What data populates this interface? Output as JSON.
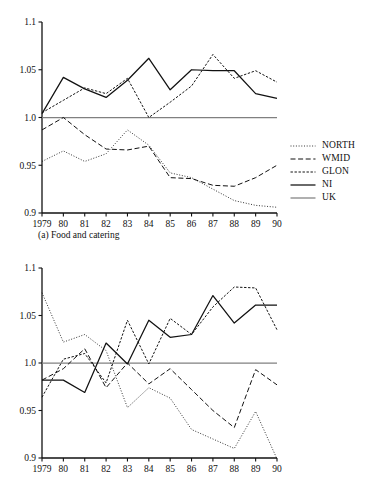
{
  "figure": {
    "background": "#ffffff",
    "width": 372,
    "height": 497
  },
  "panels": [
    {
      "id": "a",
      "caption": "(a) Food and catering",
      "legend": [
        {
          "label": "NORTH",
          "style": "dotted",
          "color": "#111111"
        },
        {
          "label": "WMID",
          "style": "dashed",
          "color": "#111111"
        },
        {
          "label": "GLON",
          "style": "shortdash",
          "color": "#111111"
        },
        {
          "label": "NI",
          "style": "solid",
          "color": "#111111"
        },
        {
          "label": "UK",
          "style": "solid",
          "color": "#808080"
        }
      ]
    },
    {
      "id": "b",
      "caption": "(b) Alcoholic drink",
      "legend": [
        {
          "label": "NORTH",
          "style": "dotted",
          "color": "#111111"
        },
        {
          "label": "EMID",
          "style": "dashed",
          "color": "#111111"
        },
        {
          "label": "WMID",
          "style": "shortdash",
          "color": "#111111"
        },
        {
          "label": "SCOT",
          "style": "solid",
          "color": "#111111"
        },
        {
          "label": "UK",
          "style": "solid",
          "color": "#808080"
        }
      ]
    }
  ],
  "chart_data": [
    {
      "type": "line",
      "title": "(a) Food and catering",
      "xlabel": "",
      "ylabel": "",
      "x": [
        1979,
        1980,
        1981,
        1982,
        1983,
        1984,
        1985,
        1986,
        1987,
        1988,
        1989,
        1990
      ],
      "xtick_labels": [
        "1979",
        "80",
        "81",
        "82",
        "83",
        "84",
        "85",
        "86",
        "87",
        "88",
        "89",
        "90"
      ],
      "ytick_labels": [
        "0.9",
        "0.95",
        "1.0",
        "1.05",
        "1.1"
      ],
      "ytick_values": [
        0.9,
        0.95,
        1.0,
        1.05,
        1.1
      ],
      "ylim": [
        0.9,
        1.1
      ],
      "grid": false,
      "legend_position": "right",
      "series": [
        {
          "name": "NORTH",
          "style": "dotted",
          "color": "#111111",
          "values": [
            0.954,
            0.965,
            0.954,
            0.962,
            0.987,
            0.971,
            0.942,
            0.937,
            0.925,
            0.913,
            0.908,
            0.906
          ]
        },
        {
          "name": "WMID",
          "style": "dashed",
          "color": "#111111",
          "values": [
            0.987,
            1.0,
            0.982,
            0.967,
            0.966,
            0.97,
            0.937,
            0.936,
            0.929,
            0.928,
            0.937,
            0.95
          ]
        },
        {
          "name": "GLON",
          "style": "shortdash",
          "color": "#111111",
          "values": [
            1.005,
            1.018,
            1.031,
            1.025,
            1.041,
            1.0,
            1.016,
            1.033,
            1.066,
            1.041,
            1.049,
            1.037
          ]
        },
        {
          "name": "NI",
          "style": "solid",
          "color": "#111111",
          "values": [
            1.004,
            1.042,
            1.03,
            1.021,
            1.039,
            1.062,
            1.029,
            1.05,
            1.049,
            1.049,
            1.025,
            1.02
          ]
        },
        {
          "name": "UK",
          "style": "solid",
          "color": "#808080",
          "values": [
            1.0,
            1.0,
            1.0,
            1.0,
            1.0,
            1.0,
            1.0,
            1.0,
            1.0,
            1.0,
            1.0,
            1.0
          ]
        }
      ]
    },
    {
      "type": "line",
      "title": "(b) Alcoholic drink",
      "xlabel": "",
      "ylabel": "",
      "x": [
        1979,
        1980,
        1981,
        1982,
        1983,
        1984,
        1985,
        1986,
        1987,
        1988,
        1989,
        1990
      ],
      "xtick_labels": [
        "1979",
        "80",
        "81",
        "82",
        "83",
        "84",
        "85",
        "86",
        "87",
        "88",
        "89",
        "90"
      ],
      "ytick_labels": [
        "0.9",
        "0.95",
        "1.0",
        "1.05",
        "1.1"
      ],
      "ytick_values": [
        0.9,
        0.95,
        1.0,
        1.05,
        1.1
      ],
      "ylim": [
        0.9,
        1.1
      ],
      "grid": false,
      "legend_position": "right",
      "series": [
        {
          "name": "NORTH",
          "style": "dotted",
          "color": "#111111",
          "values": [
            1.074,
            1.022,
            1.03,
            1.013,
            0.953,
            0.974,
            0.963,
            0.93,
            0.92,
            0.91,
            0.949,
            0.899
          ]
        },
        {
          "name": "EMID",
          "style": "dashed",
          "color": "#111111",
          "values": [
            0.982,
            0.994,
            1.015,
            0.974,
            1.0,
            0.978,
            0.994,
            0.972,
            0.95,
            0.932,
            0.993,
            0.977
          ]
        },
        {
          "name": "WMID",
          "style": "shortdash",
          "color": "#111111",
          "values": [
            0.964,
            1.004,
            1.01,
            0.979,
            1.045,
            0.999,
            1.047,
            1.03,
            1.059,
            1.08,
            1.079,
            1.035
          ]
        },
        {
          "name": "SCOT",
          "style": "solid",
          "color": "#111111",
          "values": [
            0.982,
            0.982,
            0.969,
            1.021,
            0.999,
            1.045,
            1.027,
            1.03,
            1.071,
            1.042,
            1.061,
            1.061
          ]
        },
        {
          "name": "UK",
          "style": "solid",
          "color": "#808080",
          "values": [
            1.0,
            1.0,
            1.0,
            1.0,
            1.0,
            1.0,
            1.0,
            1.0,
            1.0,
            1.0,
            1.0,
            1.0
          ]
        }
      ]
    }
  ]
}
